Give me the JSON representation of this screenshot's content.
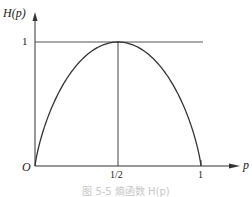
{
  "chart_data": {
    "type": "line",
    "title": "",
    "xlabel": "p",
    "ylabel": "H(p)",
    "xlim": [
      0,
      1
    ],
    "ylim": [
      0,
      1
    ],
    "x_ticks": [
      "1/2",
      "1"
    ],
    "y_ticks": [
      "1"
    ],
    "origin_label": "O",
    "grid": false,
    "series": [
      {
        "name": "H(p)",
        "function": "-p*log2(p)-(1-p)*log2(1-p)",
        "x": [
          0,
          0.05,
          0.1,
          0.2,
          0.3,
          0.4,
          0.5,
          0.6,
          0.7,
          0.8,
          0.9,
          0.95,
          1
        ],
        "values": [
          0,
          0.286,
          0.469,
          0.722,
          0.881,
          0.971,
          1,
          0.971,
          0.881,
          0.722,
          0.469,
          0.286,
          0
        ]
      }
    ],
    "reference_lines": [
      {
        "type": "horizontal",
        "y": 1
      },
      {
        "type": "vertical",
        "x": 0.5
      }
    ],
    "caption": "图 5-5 熵函数 H(p)"
  },
  "labels": {
    "y_axis": "H(p)",
    "x_axis": "p",
    "origin": "O",
    "y_tick_1": "1",
    "x_tick_half": "1/2",
    "x_tick_1": "1",
    "caption": "图 5-5 熵函数 H(p)"
  }
}
